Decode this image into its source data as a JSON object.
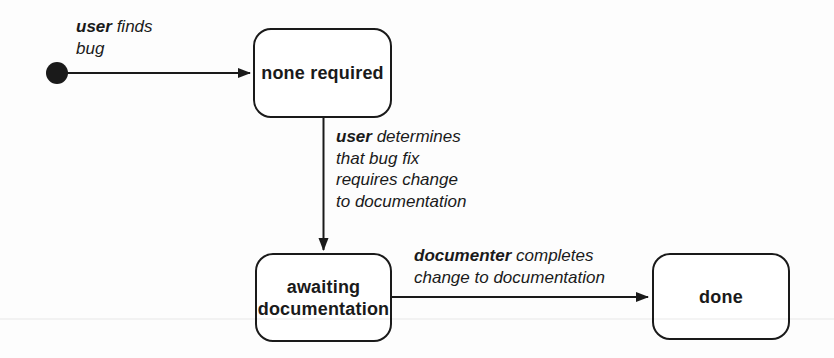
{
  "diagram": {
    "type": "uml-state-diagram",
    "background_color": "#fdfdfd",
    "line_color": "#1a1a1a",
    "state_fill_color": "#ffffff",
    "initial_state": {
      "shape": "filled-circle"
    },
    "states": [
      {
        "label": "none required"
      },
      {
        "label": "awaiting\ndocumentation"
      },
      {
        "label": "done"
      }
    ],
    "transitions": [
      {
        "actor": "user",
        "rest": " finds\nbug",
        "from": "initial",
        "to": "none required"
      },
      {
        "actor": "user",
        "rest": " determines\nthat bug fix\nrequires change\nto documentation",
        "from": "none required",
        "to": "awaiting documentation"
      },
      {
        "actor": "documenter",
        "rest": " completes\nchange to documentation",
        "from": "awaiting documentation",
        "to": "done"
      }
    ]
  }
}
